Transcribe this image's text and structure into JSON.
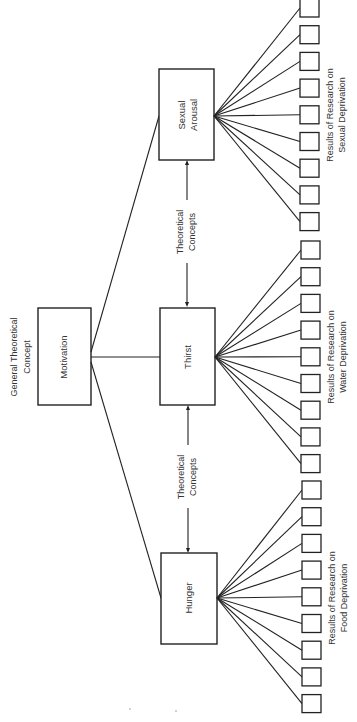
{
  "diagram": {
    "root": {
      "label": "Motivation",
      "caption_line1": "General Theoretical",
      "caption_line2": "Concept"
    },
    "concepts": [
      {
        "id": "sexual",
        "label_line1": "Sexual",
        "label_line2": "Arousal",
        "results_line1": "Results of Research on",
        "results_line2": "Sexual Deprivation",
        "result_box_count": 9
      },
      {
        "id": "thirst",
        "label_line1": "Thirst",
        "label_line2": "",
        "results_line1": "Results of Research on",
        "results_line2": "Water Deprivation",
        "result_box_count": 9
      },
      {
        "id": "hunger",
        "label_line1": "Hunger",
        "label_line2": "",
        "results_line1": "Results of Research on",
        "results_line2": "Food Deprivation",
        "result_box_count": 9
      }
    ],
    "connector_labels": [
      {
        "line1": "Theoretical",
        "line2": "Concepts"
      },
      {
        "line1": "Theoretical",
        "line2": "Concepts"
      }
    ]
  }
}
